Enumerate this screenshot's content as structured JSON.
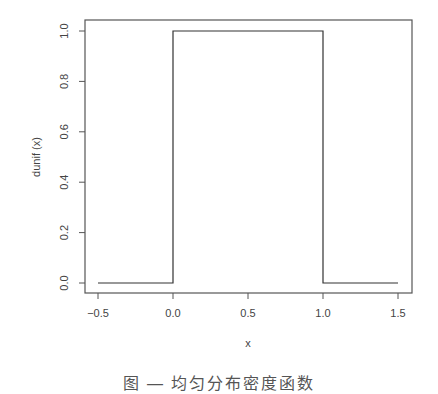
{
  "chart_data": {
    "type": "line",
    "title": "",
    "xlabel": "x",
    "ylabel": "dunif (x)",
    "xlim": [
      -0.5,
      1.5
    ],
    "ylim": [
      0,
      1
    ],
    "x_ticks": [
      "-0.5",
      "0.0",
      "0.5",
      "1.0",
      "1.5"
    ],
    "y_ticks": [
      "0.0",
      "0.2",
      "0.4",
      "0.6",
      "0.8",
      "1.0"
    ],
    "grid": false,
    "legend": null,
    "series": [
      {
        "name": "dunif(x)",
        "x": [
          -0.5,
          0.0,
          0.0,
          1.0,
          1.0,
          1.5
        ],
        "y": [
          0,
          0,
          1,
          1,
          0,
          0
        ]
      }
    ]
  },
  "caption": "图 — 均匀分布密度函数"
}
